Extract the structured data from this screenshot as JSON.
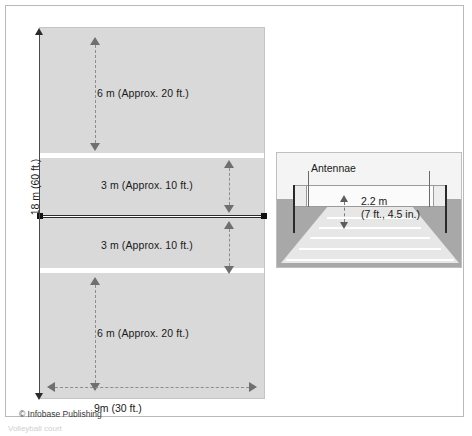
{
  "figure": {
    "title_alt": "Volleyball court dimensions diagram",
    "copyright": "© Infobase Publishing",
    "caption_fragment": "Volleyball court"
  },
  "colors": {
    "court_surface": "#d9d9d9",
    "court_line": "#ffffff",
    "net_line": "#2b2b2b",
    "dimension_arrow": "#6f6f6f",
    "frame_border": "#b9b9b9",
    "perspective_ground": "#a8a8a8",
    "perspective_floor": "#e7e7e7",
    "text": "#1a1a1a"
  },
  "overhead": {
    "length_label": "18 m (60 ft.)",
    "width_label": "9m (30 ft.)",
    "zones": [
      {
        "name": "back-zone-top",
        "label": "6 m (Approx. 20 ft.)"
      },
      {
        "name": "front-zone-top",
        "label": "3 m (Approx. 10 ft.)"
      },
      {
        "name": "front-zone-bottom",
        "label": "3 m (Approx. 10 ft.)"
      },
      {
        "name": "back-zone-bottom",
        "label": "6 m (Approx. 20 ft.)"
      }
    ]
  },
  "perspective": {
    "antennae_label": "Antennae",
    "net_height_label_line1": "2.2 m",
    "net_height_label_line2": "(7 ft., 4.5 in.)"
  },
  "chart_data": {
    "type": "diagram",
    "units": {
      "metric": "m",
      "imperial": "ft"
    },
    "court": {
      "length_m": 18,
      "length_ft": 60,
      "width_m": 9,
      "width_ft": 30,
      "back_zone_depth_m": 6,
      "back_zone_depth_ft": 20,
      "front_zone_depth_m": 3,
      "front_zone_depth_ft": 10
    },
    "net": {
      "height_m": 2.2,
      "height_ft": 7,
      "height_in": 4.5,
      "has_antennae": true
    },
    "annotations": [
      "6 m (Approx. 20 ft.)",
      "3 m (Approx. 10 ft.)",
      "3 m (Approx. 10 ft.)",
      "6 m (Approx. 20 ft.)",
      "18 m (60 ft.)",
      "9m (30 ft.)",
      "2.2 m",
      "(7 ft., 4.5 in.)",
      "Antennae"
    ]
  }
}
